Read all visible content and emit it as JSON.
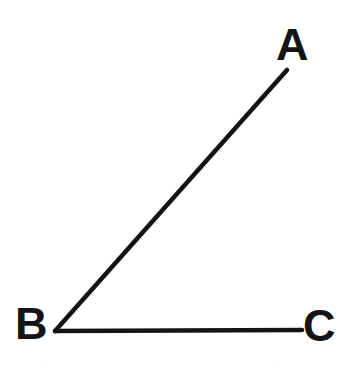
{
  "figure": {
    "background_color": "#ffffff",
    "stroke_color": "#141414",
    "stroke_width": 4.5,
    "canvas": {
      "width": 355,
      "height": 376
    },
    "points": [
      {
        "id": "A",
        "label": "A",
        "x": 287,
        "y": 70,
        "label_x": 290,
        "label_y": 45
      },
      {
        "id": "B",
        "label": "B",
        "x": 55,
        "y": 331,
        "label_x": 30,
        "label_y": 323
      },
      {
        "id": "C",
        "label": "C",
        "x": 302,
        "y": 330,
        "label_x": 318,
        "label_y": 325
      }
    ],
    "segments": [
      {
        "id": "ray-BA",
        "from": "B",
        "to": "A",
        "x1": 55,
        "y1": 331,
        "x2": 287,
        "y2": 70
      },
      {
        "id": "ray-BC",
        "from": "B",
        "to": "C",
        "x1": 55,
        "y1": 331,
        "x2": 302,
        "y2": 330
      }
    ],
    "vertex": "B",
    "angle_name": "ABC"
  }
}
